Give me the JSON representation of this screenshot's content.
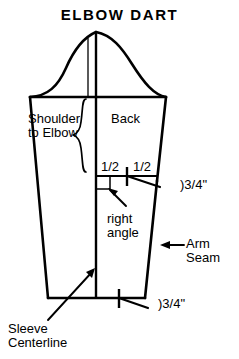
{
  "figure": {
    "title": "ELBOW DART",
    "kind": "sewing-pattern-sleeve-diagram"
  },
  "labels": {
    "shoulder_to_elbow": "Shoulder\nto Elbow",
    "back": "Back",
    "half_left": "1/2",
    "half_right": "1/2",
    "dart_opening": ")3/4\"",
    "right_angle": "right\nangle",
    "arm_seam": "Arm\nSeam",
    "hem_opening": ")3/4\"",
    "sleeve_centerline": "Sleeve\nCenterline"
  },
  "colors": {
    "ink": "#000000",
    "paper": "#ffffff"
  },
  "geometry": {
    "cap_apex": [
      96,
      32
    ],
    "bicep_line_y": 97,
    "hem_line_y": 298,
    "dart_line_y": 176,
    "centerline_x": 96,
    "left_top_x": 30,
    "left_hem_x": 48,
    "right_top_x": 166,
    "right_hem_x": 145
  },
  "annotations": {
    "right_angle_marker": "small-square",
    "dart_tick": "center-tick-mark",
    "hem_tick": "center-tick-mark"
  }
}
